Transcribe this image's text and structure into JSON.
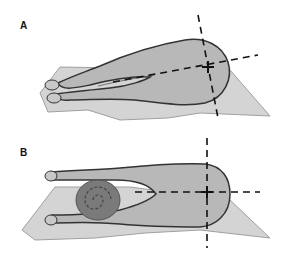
{
  "figure": {
    "panels": [
      {
        "id": "A",
        "label": "A",
        "description": "Animal in dorsal recumbency with hind limbs extended caudally; dashed cross marks center of thorax/abdomen"
      },
      {
        "id": "B",
        "label": "B",
        "description": "Animal in dorsal recumbency with hind limbs separated and a rolled towel placed between them; dashed cross marks center"
      }
    ],
    "colors": {
      "background": "#ffffff",
      "table": "#d4d4d4",
      "table_edge": "#9a9a9a",
      "body_fill": "#b8b8b8",
      "body_outline": "#333333",
      "towel": "#7a7a7a",
      "dash": "#111111"
    }
  }
}
